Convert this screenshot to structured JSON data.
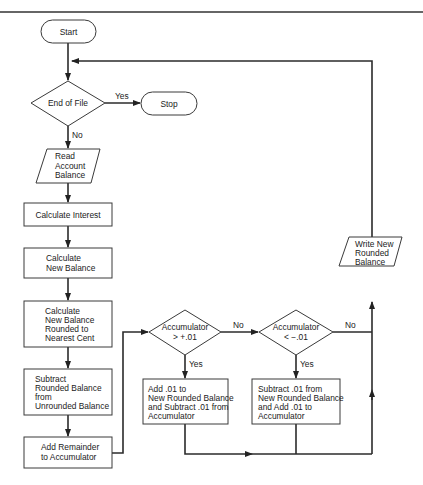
{
  "diagram": {
    "type": "flowchart",
    "nodes": {
      "start": {
        "shape": "terminal",
        "label": "Start"
      },
      "end_of_file": {
        "shape": "decision",
        "label": "End of File"
      },
      "stop": {
        "shape": "terminal",
        "label": "Stop"
      },
      "read_balance": {
        "shape": "io",
        "lines": [
          "Read",
          "Account",
          "Balance"
        ]
      },
      "calc_interest": {
        "shape": "process",
        "label": "Calculate Interest"
      },
      "calc_new_balance": {
        "shape": "process",
        "lines": [
          "Calculate",
          "New Balance"
        ]
      },
      "calc_rounded": {
        "shape": "process",
        "lines": [
          "Calculate",
          "New Balance",
          "Rounded to",
          "Nearest Cent"
        ]
      },
      "subtract_rounded": {
        "shape": "process",
        "lines": [
          "Subtract",
          "Rounded Balance",
          "from",
          "Unrounded Balance"
        ]
      },
      "add_remainder": {
        "shape": "process",
        "lines": [
          "Add Remainder",
          "to Accumulator"
        ]
      },
      "acc_gt": {
        "shape": "decision",
        "lines": [
          "Accumulator",
          "> +.01"
        ]
      },
      "acc_lt": {
        "shape": "decision",
        "lines": [
          "Accumulator",
          "< −.01"
        ]
      },
      "add_01": {
        "shape": "process",
        "lines": [
          "Add .01 to",
          "New Rounded Balance",
          "and Subtract .01 from",
          "Accumulator"
        ]
      },
      "sub_01": {
        "shape": "process",
        "lines": [
          "Subtract .01 from",
          "New Rounded Balance",
          "and Add .01 to",
          "Accumulator"
        ]
      },
      "write_balance": {
        "shape": "io",
        "lines": [
          "Write New",
          "Rounded",
          "Balance"
        ]
      }
    },
    "edge_labels": {
      "eof_yes": "Yes",
      "eof_no": "No",
      "gt_no": "No",
      "gt_yes": "Yes",
      "lt_no": "No",
      "lt_yes": "Yes"
    },
    "edges": [
      [
        "start",
        "end_of_file",
        ""
      ],
      [
        "end_of_file",
        "stop",
        "Yes"
      ],
      [
        "end_of_file",
        "read_balance",
        "No"
      ],
      [
        "read_balance",
        "calc_interest",
        ""
      ],
      [
        "calc_interest",
        "calc_new_balance",
        ""
      ],
      [
        "calc_new_balance",
        "calc_rounded",
        ""
      ],
      [
        "calc_rounded",
        "subtract_rounded",
        ""
      ],
      [
        "subtract_rounded",
        "add_remainder",
        ""
      ],
      [
        "add_remainder",
        "acc_gt",
        ""
      ],
      [
        "acc_gt",
        "acc_lt",
        "No"
      ],
      [
        "acc_gt",
        "add_01",
        "Yes"
      ],
      [
        "acc_lt",
        "sub_01",
        "Yes"
      ],
      [
        "acc_lt",
        "write_balance",
        "No"
      ],
      [
        "add_01",
        "write_balance",
        ""
      ],
      [
        "sub_01",
        "write_balance",
        ""
      ],
      [
        "write_balance",
        "end_of_file",
        ""
      ]
    ]
  }
}
